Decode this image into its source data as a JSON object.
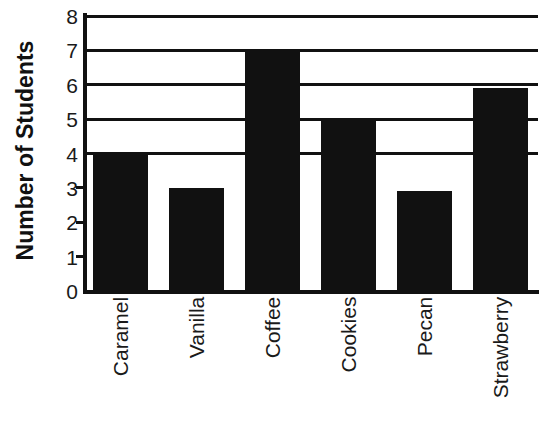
{
  "chart_data": {
    "type": "bar",
    "title": "",
    "xlabel": "",
    "ylabel": "Number of Students",
    "categories": [
      "Caramel",
      "Vanilla",
      "Coffee",
      "Cookies",
      "Pecan",
      "Strawberry"
    ],
    "values": [
      4,
      3,
      7,
      4.95,
      2.9,
      5.9
    ],
    "ylim": [
      0,
      8
    ],
    "ytick_labels": [
      "0",
      "1",
      "2",
      "3",
      "4",
      "5",
      "6",
      "7",
      "8"
    ],
    "ytick_values": [
      0,
      1,
      2,
      3,
      4,
      5,
      6,
      7,
      8
    ],
    "gridlines_at": [
      4,
      5,
      6,
      7,
      8
    ],
    "grid": true,
    "legend": "none",
    "bar_color": "#111111",
    "axis_color": "#111111"
  },
  "axis": {
    "y_title": "Number of Students"
  }
}
